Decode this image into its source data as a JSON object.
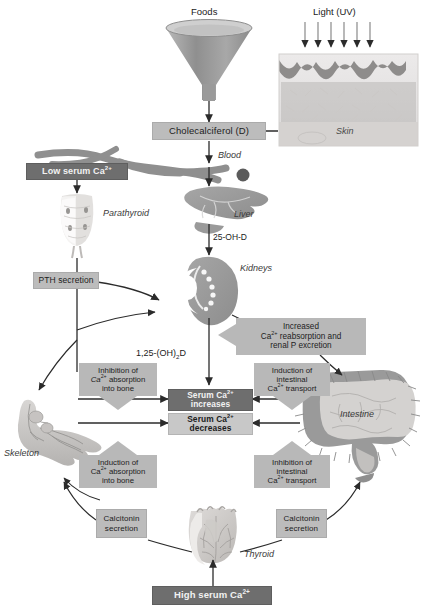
{
  "diagram": {
    "colors": {
      "dark_box": "#6e6e6e",
      "mid_box": "#8a8a8a",
      "light_box": "#bcbcbc",
      "callout": "#b8b8b8",
      "organ_fill": "#9a9a9a",
      "arrow": "#2b2b2b",
      "background": "#ffffff"
    }
  },
  "labels": {
    "foods": "Foods",
    "light_uv": "Light (UV)",
    "skin": "Skin",
    "blood": "Blood",
    "liver": "Liver",
    "kidneys": "Kidneys",
    "parathyroid": "Parathyroid",
    "skeleton": "Skeleton",
    "intestine": "Intestine",
    "thyroid": "Thyroid"
  },
  "pathway_labels": {
    "hydroxy_d": "25-OH-D",
    "calcitriol_pre": "1,25-(OH)",
    "calcitriol_sub": "2",
    "calcitriol_post": "D"
  },
  "boxes": {
    "cholecalciferol": "Cholecalciferol (D)",
    "low_serum_ca": {
      "pre": "Low serum Ca",
      "sup": "2+"
    },
    "high_serum_ca": {
      "pre": "High serum Ca",
      "sup": "2+"
    },
    "pth_secretion": "PTH secretion",
    "serum_ca_increases": {
      "pre": "Serum Ca",
      "sup": "2+",
      "post": "increases"
    },
    "serum_ca_decreases": {
      "pre": "Serum Ca",
      "sup": "2+",
      "post": "decreases"
    },
    "calcitonin_secretion_left": "Calcitonin secretion",
    "calcitonin_secretion_right": "Calcitonin secretion"
  },
  "callouts": {
    "increased_reabsorption": {
      "line1": "Increased",
      "line2_pre": "Ca",
      "line2_sup": "2+",
      "line2_post": " reabsorption and",
      "line3": "renal P excretion"
    },
    "inhibition_bone": {
      "line1": "Inhibition of",
      "line2_pre": "Ca",
      "line2_sup": "2+",
      "line2_post": " absorption",
      "line3": "into bone"
    },
    "induction_bone": {
      "line1": "Induction of",
      "line2_pre": "Ca",
      "line2_sup": "2+",
      "line2_post": " absorption",
      "line3": "into bone"
    },
    "induction_intestinal": {
      "line1": "Induction of",
      "line2": "intestinal",
      "line3_pre": "Ca",
      "line3_sup": "2+",
      "line3_post": " transport"
    },
    "inhibition_intestinal": {
      "line1": "Inhibition of",
      "line2": "intestinal",
      "line3_pre": "Ca",
      "line3_sup": "2+",
      "line3_post": " transport"
    }
  }
}
